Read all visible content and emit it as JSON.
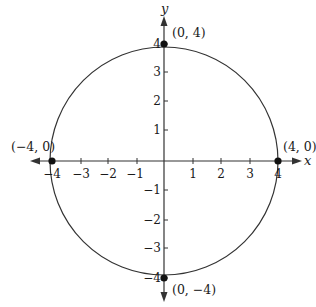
{
  "diagram": {
    "type": "coordinate-plane-circle",
    "axes": {
      "x_label": "x",
      "y_label": "y",
      "x_ticks": [
        "−4",
        "−3",
        "−2",
        "−1",
        "1",
        "2",
        "3",
        "4"
      ],
      "y_ticks": [
        "4",
        "3",
        "2",
        "1",
        "−1",
        "−2",
        "−3",
        "−4"
      ]
    },
    "circle": {
      "center": [
        0,
        0
      ],
      "radius": 4,
      "equation": "x^2 + y^2 = 16"
    },
    "points": [
      {
        "label": "(0, 4)",
        "x": 0,
        "y": 4
      },
      {
        "label": "(−4, 0)",
        "x": -4,
        "y": 0
      },
      {
        "label": "(4, 0)",
        "x": 4,
        "y": 0
      },
      {
        "label": "(0, −4)",
        "x": 0,
        "y": -4
      }
    ],
    "colors": {
      "line": "#333333",
      "point": "#111111",
      "background": "#ffffff"
    }
  }
}
